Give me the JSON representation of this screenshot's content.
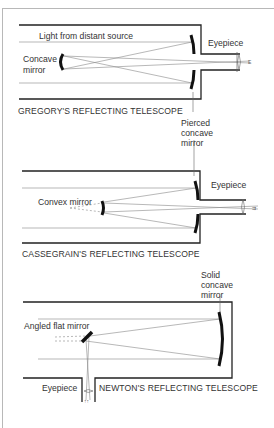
{
  "diagrams": [
    {
      "id": "gregory",
      "title": "GREGORY'S REFLECTING TELESCOPE",
      "labels": {
        "light": "Light from distant source",
        "secondary": "Concave\nmirror",
        "secondary_line1": "Concave",
        "secondary_line2": "mirror",
        "eyepiece": "Eyepiece",
        "primary_line1": "Pierced",
        "primary_line2": "concave",
        "primary_line3": "mirror"
      }
    },
    {
      "id": "cassegrain",
      "title": "CASSEGRAIN'S REFLECTING TELESCOPE",
      "labels": {
        "secondary": "Convex mirror",
        "eyepiece": "Eyepiece"
      }
    },
    {
      "id": "newton",
      "title": "NEWTON'S REFLECTING TELESCOPE",
      "labels": {
        "secondary": "Angled flat mirror",
        "eyepiece": "Eyepiece",
        "primary_line1": "Solid",
        "primary_line2": "concave",
        "primary_line3": "mirror"
      }
    }
  ],
  "colors": {
    "stroke": "#222222",
    "ray": "#777777",
    "text": "#333333",
    "frame": "#b8b8b8"
  }
}
